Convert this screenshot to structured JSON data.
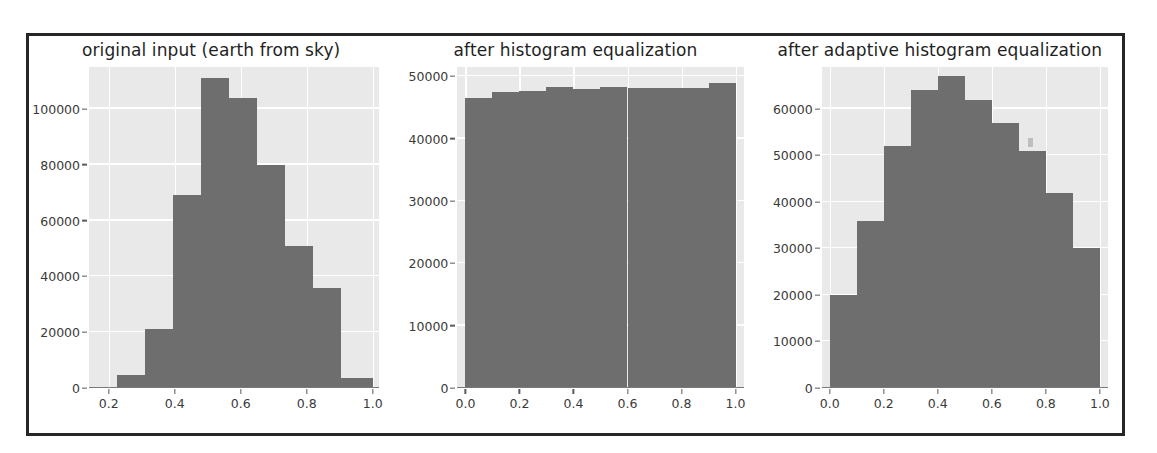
{
  "figure": {
    "background": "#ffffff",
    "frame_color": "#262626",
    "plot_background": "#e9e9e9",
    "grid_color": "#ffffff",
    "bar_color": "#6e6e6e",
    "tick_text_color": "#3a3a3a",
    "title_color": "#1f1f1f"
  },
  "chart_data": [
    {
      "type": "bar",
      "title": "original input (earth from sky)",
      "xlabel": "",
      "ylabel": "",
      "xlim": [
        0.14,
        1.02
      ],
      "ylim": [
        0,
        115000
      ],
      "grid": true,
      "legend": "none",
      "xticks": [
        "0.2",
        "0.4",
        "0.6",
        "0.8",
        "1.0"
      ],
      "xtick_values": [
        0.2,
        0.4,
        0.6,
        0.8,
        1.0
      ],
      "yticks": [
        "0",
        "20000",
        "40000",
        "60000",
        "80000",
        "100000"
      ],
      "ytick_values": [
        0,
        20000,
        40000,
        60000,
        80000,
        100000
      ],
      "bin_edges": [
        0.14,
        0.225,
        0.31,
        0.395,
        0.48,
        0.565,
        0.65,
        0.735,
        0.82,
        0.905,
        1.0
      ],
      "categories": [
        "0.14-0.23",
        "0.23-0.31",
        "0.31-0.40",
        "0.40-0.48",
        "0.48-0.57",
        "0.57-0.65",
        "0.65-0.74",
        "0.74-0.82",
        "0.82-0.91",
        "0.91-1.00"
      ],
      "values": [
        300,
        4500,
        21000,
        69000,
        111000,
        104000,
        80000,
        51000,
        36000,
        3500
      ]
    },
    {
      "type": "bar",
      "title": "after histogram equalization",
      "xlabel": "",
      "ylabel": "",
      "xlim": [
        -0.03,
        1.03
      ],
      "ylim": [
        0,
        51500
      ],
      "grid": true,
      "legend": "none",
      "xticks": [
        "0.0",
        "0.2",
        "0.4",
        "0.6",
        "0.8",
        "1.0"
      ],
      "xtick_values": [
        0.0,
        0.2,
        0.4,
        0.6,
        0.8,
        1.0
      ],
      "yticks": [
        "0",
        "10000",
        "20000",
        "30000",
        "40000",
        "50000"
      ],
      "ytick_values": [
        0,
        10000,
        20000,
        30000,
        40000,
        50000
      ],
      "bin_edges": [
        0.0,
        0.1,
        0.2,
        0.3,
        0.4,
        0.5,
        0.6,
        0.7,
        0.8,
        0.9,
        1.0
      ],
      "categories": [
        "0.0-0.1",
        "0.1-0.2",
        "0.2-0.3",
        "0.3-0.4",
        "0.4-0.5",
        "0.5-0.6",
        "0.6-0.7",
        "0.7-0.8",
        "0.8-0.9",
        "0.9-1.0"
      ],
      "values": [
        46500,
        47500,
        47600,
        48300,
        48000,
        48300,
        48200,
        48100,
        48200,
        48900
      ]
    },
    {
      "type": "bar",
      "title": "after adaptive histogram equalization",
      "xlabel": "",
      "ylabel": "",
      "xlim": [
        -0.03,
        1.03
      ],
      "ylim": [
        0,
        69000
      ],
      "grid": true,
      "legend": "none",
      "xticks": [
        "0.0",
        "0.2",
        "0.4",
        "0.6",
        "0.8",
        "1.0"
      ],
      "xtick_values": [
        0.0,
        0.2,
        0.4,
        0.6,
        0.8,
        1.0
      ],
      "yticks": [
        "0",
        "10000",
        "20000",
        "30000",
        "40000",
        "50000",
        "60000"
      ],
      "ytick_values": [
        0,
        10000,
        20000,
        30000,
        40000,
        50000,
        60000
      ],
      "bin_edges": [
        0.0,
        0.1,
        0.2,
        0.3,
        0.4,
        0.5,
        0.6,
        0.7,
        0.8,
        0.9,
        1.0
      ],
      "categories": [
        "0.0-0.1",
        "0.1-0.2",
        "0.2-0.3",
        "0.3-0.4",
        "0.4-0.5",
        "0.5-0.6",
        "0.6-0.7",
        "0.7-0.8",
        "0.8-0.9",
        "0.9-1.0"
      ],
      "values": [
        20000,
        36000,
        52000,
        64000,
        67000,
        62000,
        57000,
        51000,
        42000,
        30000
      ]
    }
  ]
}
